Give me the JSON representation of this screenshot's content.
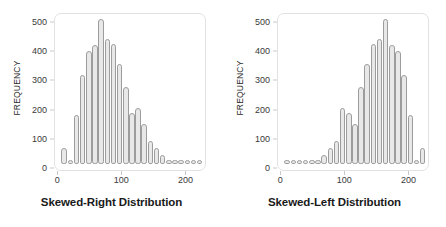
{
  "figure": {
    "background": "#ffffff",
    "bar_fill": "#e8e8e8",
    "bar_stroke": "#9c9c9c",
    "frame_color": "#e2e2e2",
    "axis_text_color": "#3a3a3a"
  },
  "panels": [
    {
      "id": "skewed-right",
      "title": "Skewed-Right Distribution",
      "ylabel": "FREQUENCY",
      "yticks": [
        0,
        100,
        200,
        300,
        400,
        500
      ],
      "xticks": [
        0,
        100,
        200
      ]
    },
    {
      "id": "skewed-left",
      "title": "Skewed-Left Distribution",
      "ylabel": "FREQUENCY",
      "yticks": [
        0,
        100,
        200,
        300,
        400,
        500
      ],
      "xticks": [
        0,
        100,
        200
      ]
    }
  ],
  "chart_data": [
    {
      "type": "bar",
      "id": "skewed-right",
      "title": "Skewed-Right Distribution",
      "xlabel": "Skewed-Right Distribution",
      "ylabel": "FREQUENCY",
      "xlim": [
        -5,
        232
      ],
      "ylim": [
        0,
        520
      ],
      "ytick_values": [
        0,
        100,
        200,
        300,
        400,
        500
      ],
      "xtick_values": [
        0,
        100,
        200
      ],
      "grid": false,
      "legend": null,
      "bin_width": 9,
      "x": [
        5,
        15,
        25,
        35,
        45,
        55,
        65,
        75,
        85,
        95,
        105,
        115,
        125,
        135,
        145,
        155,
        165,
        175,
        185,
        195,
        205,
        215,
        225
      ],
      "values": [
        55,
        8,
        172,
        313,
        397,
        418,
        510,
        440,
        423,
        350,
        271,
        180,
        198,
        142,
        82,
        55,
        30,
        10,
        8,
        7,
        6,
        6,
        6
      ]
    },
    {
      "type": "bar",
      "id": "skewed-left",
      "title": "Skewed-Left Distribution",
      "xlabel": "Skewed-Left Distribution",
      "ylabel": "FREQUENCY",
      "xlim": [
        -5,
        232
      ],
      "ylim": [
        0,
        520
      ],
      "ytick_values": [
        0,
        100,
        200,
        300,
        400,
        500
      ],
      "xtick_values": [
        0,
        100,
        200
      ],
      "grid": false,
      "legend": null,
      "bin_width": 9,
      "x": [
        5,
        15,
        25,
        35,
        45,
        55,
        65,
        75,
        85,
        95,
        105,
        115,
        125,
        135,
        145,
        155,
        165,
        175,
        185,
        195,
        205,
        215,
        225
      ],
      "values": [
        6,
        6,
        6,
        7,
        8,
        10,
        30,
        55,
        82,
        198,
        180,
        142,
        271,
        350,
        423,
        440,
        510,
        418,
        397,
        313,
        172,
        8,
        55
      ]
    }
  ]
}
